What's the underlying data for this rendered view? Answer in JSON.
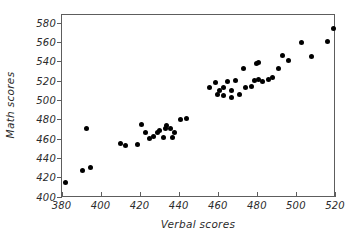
{
  "chart_data": {
    "type": "scatter",
    "title": "",
    "xlabel": "Verbal scores",
    "ylabel": "Math scores",
    "xlim": [
      380,
      520
    ],
    "ylim": [
      400,
      580
    ],
    "xticks": [
      380,
      400,
      420,
      440,
      460,
      480,
      500,
      520
    ],
    "yticks": [
      400,
      420,
      440,
      460,
      480,
      500,
      520,
      540,
      560,
      580
    ],
    "grid": false,
    "legend": null,
    "marker": "filled-circle",
    "marker_color": "#000000",
    "points": [
      {
        "x": 382,
        "y": 414
      },
      {
        "x": 391,
        "y": 427
      },
      {
        "x": 395,
        "y": 430
      },
      {
        "x": 393,
        "y": 470
      },
      {
        "x": 410,
        "y": 455
      },
      {
        "x": 413,
        "y": 453
      },
      {
        "x": 419,
        "y": 454
      },
      {
        "x": 421,
        "y": 474
      },
      {
        "x": 423,
        "y": 466
      },
      {
        "x": 425,
        "y": 460
      },
      {
        "x": 427,
        "y": 462
      },
      {
        "x": 429,
        "y": 466
      },
      {
        "x": 430,
        "y": 468
      },
      {
        "x": 432,
        "y": 461
      },
      {
        "x": 433,
        "y": 470
      },
      {
        "x": 434,
        "y": 473
      },
      {
        "x": 436,
        "y": 470
      },
      {
        "x": 437,
        "y": 461
      },
      {
        "x": 438,
        "y": 466
      },
      {
        "x": 441,
        "y": 480
      },
      {
        "x": 444,
        "y": 481
      },
      {
        "x": 456,
        "y": 513
      },
      {
        "x": 459,
        "y": 518
      },
      {
        "x": 460,
        "y": 506
      },
      {
        "x": 461,
        "y": 510
      },
      {
        "x": 463,
        "y": 513
      },
      {
        "x": 463,
        "y": 505
      },
      {
        "x": 465,
        "y": 519
      },
      {
        "x": 467,
        "y": 502
      },
      {
        "x": 467,
        "y": 510
      },
      {
        "x": 469,
        "y": 520
      },
      {
        "x": 471,
        "y": 506
      },
      {
        "x": 473,
        "y": 532
      },
      {
        "x": 474,
        "y": 513
      },
      {
        "x": 477,
        "y": 514
      },
      {
        "x": 479,
        "y": 520
      },
      {
        "x": 480,
        "y": 538
      },
      {
        "x": 481,
        "y": 539
      },
      {
        "x": 481,
        "y": 521
      },
      {
        "x": 483,
        "y": 519
      },
      {
        "x": 486,
        "y": 521
      },
      {
        "x": 488,
        "y": 523
      },
      {
        "x": 491,
        "y": 532
      },
      {
        "x": 493,
        "y": 546
      },
      {
        "x": 496,
        "y": 541
      },
      {
        "x": 503,
        "y": 559
      },
      {
        "x": 508,
        "y": 545
      },
      {
        "x": 516,
        "y": 560
      },
      {
        "x": 519,
        "y": 574
      }
    ]
  },
  "axes": {
    "x_tick_labels": [
      "380",
      "400",
      "420",
      "440",
      "460",
      "480",
      "500",
      "520"
    ],
    "y_tick_labels": [
      "400",
      "420",
      "440",
      "460",
      "480",
      "500",
      "520",
      "540",
      "560",
      "580"
    ],
    "x_title": "Verbal scores",
    "y_title": "Math scores"
  }
}
